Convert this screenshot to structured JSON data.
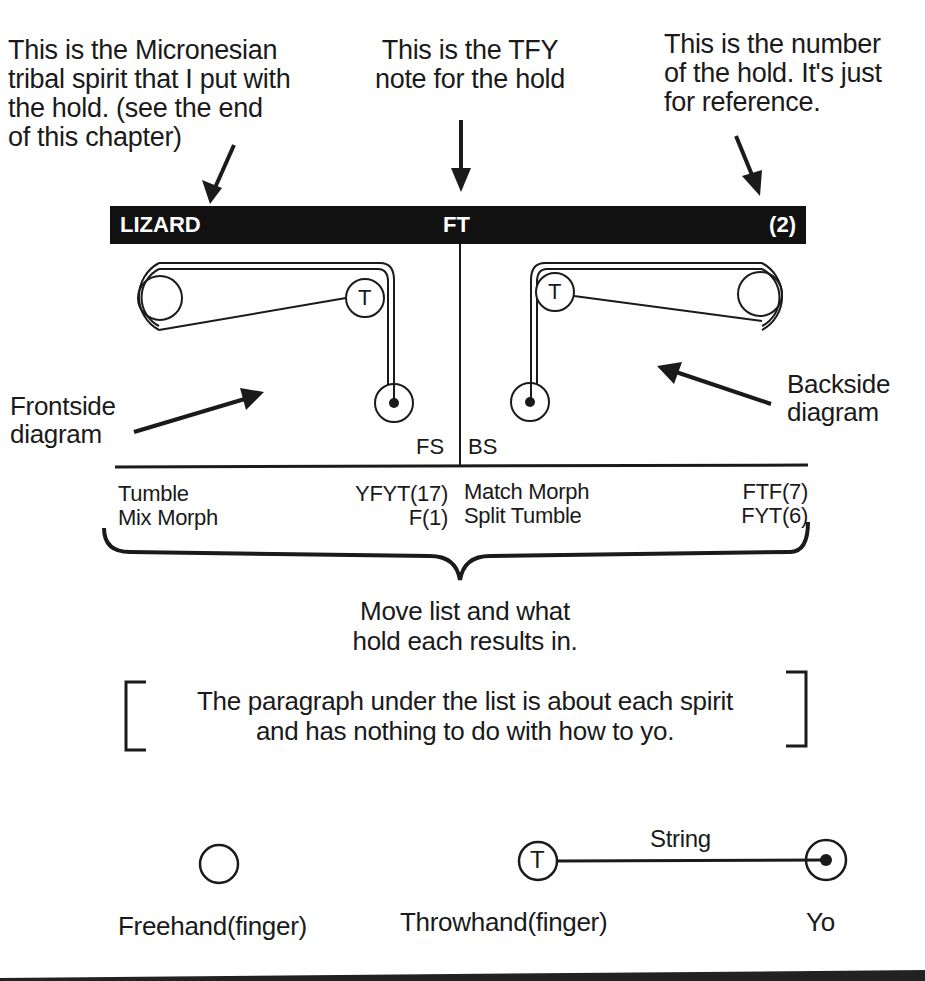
{
  "annotations": {
    "spirit_note": [
      "This is the Micronesian",
      "tribal spirit that I put with",
      "the hold. (see the end",
      "of this chapter)"
    ],
    "tfy_note": [
      "This is the TFY",
      "note for the hold"
    ],
    "number_note": [
      "This is the number",
      "of the hold. It's just",
      "for reference."
    ],
    "frontside_label": [
      "Frontside",
      "diagram"
    ],
    "backside_label": [
      "Backside",
      "diagram"
    ]
  },
  "header": {
    "spirit": "LIZARD",
    "tfy": "FT",
    "number": "(2)",
    "bar_color": "#111111",
    "text_color": "#ffffff"
  },
  "diagram": {
    "frontside_tag": "FS",
    "backside_tag": "BS",
    "throwhand_letter": "T"
  },
  "move_list": {
    "left": [
      {
        "move": "Tumble",
        "result": "YFYT(17)"
      },
      {
        "move": "Mix Morph",
        "result": "F(1)"
      }
    ],
    "right": [
      {
        "move": "Match Morph",
        "result": "FTF(7)"
      },
      {
        "move": "Split Tumble",
        "result": "FYT(6)"
      }
    ]
  },
  "move_list_caption": [
    "Move list and what",
    "hold each results in."
  ],
  "paragraph_note": [
    "The paragraph under the list is about each spirit",
    "and has nothing to do with how to yo."
  ],
  "legend": {
    "freehand": "Freehand(finger)",
    "throwhand": "Throwhand(finger)",
    "throwhand_letter": "T",
    "string": "String",
    "yo": "Yo"
  }
}
